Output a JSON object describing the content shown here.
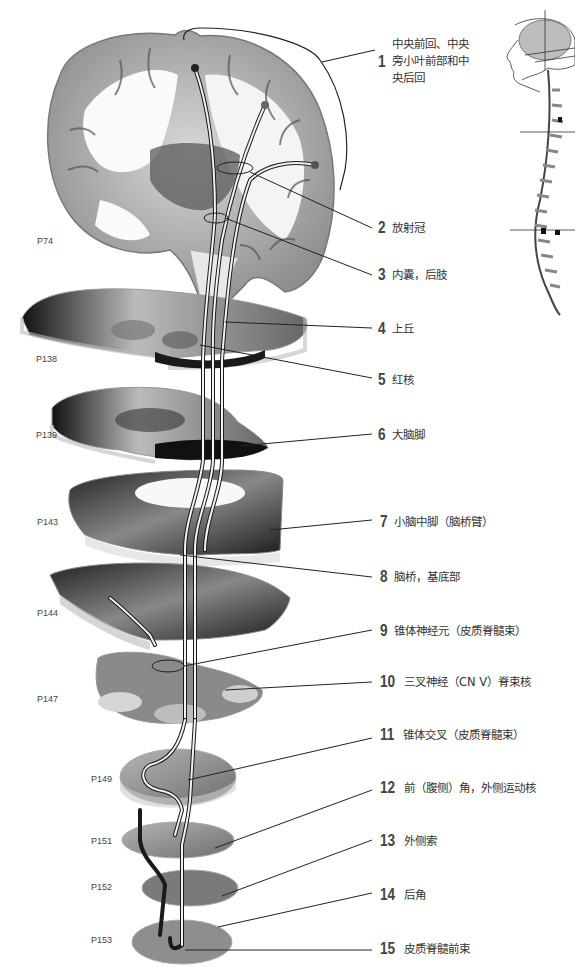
{
  "figure": {
    "locator": "head-and-spine-locator-illustration"
  },
  "sections": [
    {
      "id": "P74",
      "label": "P74"
    },
    {
      "id": "P138",
      "label": "P138"
    },
    {
      "id": "P139",
      "label": "P139"
    },
    {
      "id": "P143",
      "label": "P143"
    },
    {
      "id": "P144",
      "label": "P144"
    },
    {
      "id": "P147",
      "label": "P147"
    },
    {
      "id": "P149",
      "label": "P149"
    },
    {
      "id": "P151",
      "label": "P151"
    },
    {
      "id": "P152",
      "label": "P152"
    },
    {
      "id": "P153",
      "label": "P153"
    }
  ],
  "labels": [
    {
      "num": "1",
      "text": "中央前回、中央旁小叶前部和中央后回"
    },
    {
      "num": "2",
      "text": "放射冠"
    },
    {
      "num": "3",
      "text": "内囊，后肢"
    },
    {
      "num": "4",
      "text": "上丘"
    },
    {
      "num": "5",
      "text": "红核"
    },
    {
      "num": "6",
      "text": "大脑脚"
    },
    {
      "num": "7",
      "text": "小脑中脚（脑桥臂）"
    },
    {
      "num": "8",
      "text": "脑桥，基底部"
    },
    {
      "num": "9",
      "text": "锥体神经元（皮质脊髓束）"
    },
    {
      "num": "10",
      "text": "三叉神经（CN Ⅴ）脊束核"
    },
    {
      "num": "11",
      "text": "锥体交叉（皮质脊髓束）"
    },
    {
      "num": "12",
      "text": "前（腹侧）角，外侧运动核"
    },
    {
      "num": "13",
      "text": "外侧索"
    },
    {
      "num": "14",
      "text": "后角"
    },
    {
      "num": "15",
      "text": "皮质脊髓前束"
    }
  ],
  "colors": {
    "background": "#ffffff",
    "leader_line": "#222222",
    "tract_dark": "#1a1a1a",
    "tract_light": "#f2f2f2",
    "tissue_gray": "#9a9a9a",
    "tissue_dark": "#2a2a2a"
  }
}
